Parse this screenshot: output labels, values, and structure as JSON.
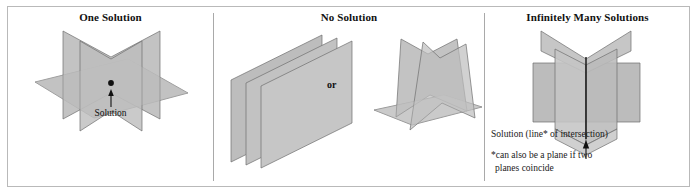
{
  "figure": {
    "panels": [
      {
        "id": "one-solution",
        "title": "One Solution",
        "label": "Solution",
        "marker": "point"
      },
      {
        "id": "no-solution",
        "title": "No Solution",
        "connector": "or"
      },
      {
        "id": "infinitely-many-solutions",
        "title": "Infinitely Many Solutions",
        "caption_line": "Solution (line* of intersection)",
        "caption_note_1": "*can also be a plane if two",
        "caption_note_2": "planes coincide"
      }
    ]
  },
  "colors": {
    "frame_border": "#b9b9b9",
    "divider": "#a9a9a9",
    "plane_light": "#c9c9c9",
    "plane_mid": "#b5b5b5",
    "plane_dark": "#a3a3a3",
    "plane_edge": "#6f6f6f",
    "text": "#111111",
    "background": "#ffffff"
  }
}
